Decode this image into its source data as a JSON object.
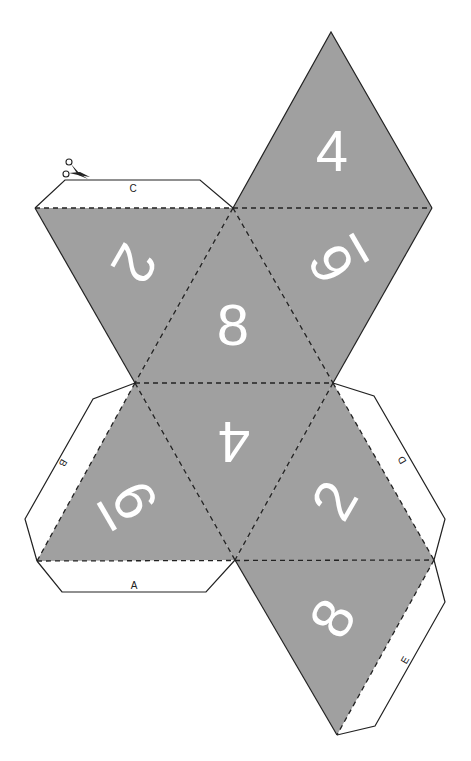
{
  "colors": {
    "face": "#a0a0a0",
    "number": "#ffffff",
    "line": "#222222",
    "background": "#ffffff"
  },
  "faces": [
    {
      "id": "top",
      "number": "4",
      "underline": false
    },
    {
      "id": "upper-left",
      "number": "2",
      "underline": false
    },
    {
      "id": "upper-center",
      "number": "8",
      "underline": false
    },
    {
      "id": "upper-right",
      "number": "6",
      "underline": true
    },
    {
      "id": "lower-left",
      "number": "6",
      "underline": true
    },
    {
      "id": "lower-center",
      "number": "4",
      "underline": false
    },
    {
      "id": "lower-right",
      "number": "2",
      "underline": false
    },
    {
      "id": "bottom",
      "number": "8",
      "underline": false
    }
  ],
  "tabs": [
    {
      "id": "tab-a",
      "label": "A"
    },
    {
      "id": "tab-b",
      "label": "B"
    },
    {
      "id": "tab-c",
      "label": "C"
    },
    {
      "id": "tab-d",
      "label": "D"
    },
    {
      "id": "tab-e",
      "label": "E"
    }
  ],
  "icons": {
    "scissors": "scissors-icon"
  }
}
